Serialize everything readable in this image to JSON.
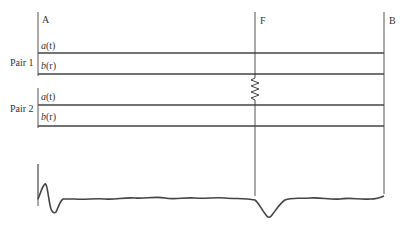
{
  "diagram": {
    "points": {
      "A": "A",
      "F": "F",
      "B": "B"
    },
    "pairs": [
      {
        "label": "Pair 1",
        "lines": [
          {
            "name": "a",
            "arg": "(t)"
          },
          {
            "name": "b",
            "arg": "(r)"
          }
        ]
      },
      {
        "label": "Pair 2",
        "lines": [
          {
            "name": "a",
            "arg": "(t)"
          },
          {
            "name": "b",
            "arg": "(r)"
          }
        ]
      }
    ],
    "fault_symbol": "zigzag-resistor-between-pair1-b-and-pair2-a",
    "trace": "reflection-waveform-with-dip-at-F",
    "colors": {
      "line": "#444444",
      "background": "#ffffff"
    }
  }
}
